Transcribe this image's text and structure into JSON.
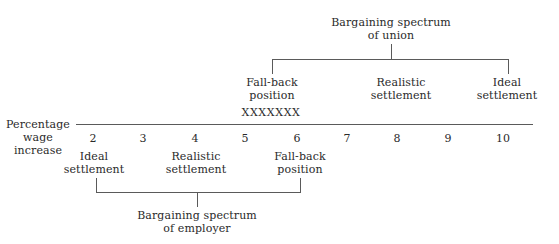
{
  "axis": {
    "label": [
      "Percentage",
      "wage",
      "increase"
    ],
    "ticks": [
      "2",
      "3",
      "4",
      "5",
      "6",
      "7",
      "8",
      "9",
      "10"
    ]
  },
  "union": {
    "title": [
      "Bargaining spectrum",
      "of union"
    ],
    "fallback": [
      "Fall-back",
      "position"
    ],
    "realistic": [
      "Realistic",
      "settlement"
    ],
    "ideal": [
      "Ideal",
      "settlement"
    ]
  },
  "overlap_marker": "XXXXXXX",
  "employer": {
    "title": [
      "Bargaining spectrum",
      "of employer"
    ],
    "ideal": [
      "Ideal",
      "settlement"
    ],
    "realistic": [
      "Realistic",
      "settlement"
    ],
    "fallback": [
      "Fall-back",
      "position"
    ]
  },
  "colors": {
    "line": "#5a5a5a",
    "text": "#2a2a2a",
    "background": "#ffffff"
  }
}
